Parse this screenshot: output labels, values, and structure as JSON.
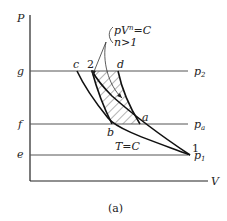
{
  "figure": {
    "caption": "(a)",
    "axes": {
      "y_label": "P",
      "x_label": "V"
    },
    "pressure_levels": [
      {
        "left_label": "g",
        "right_label": "p",
        "right_sub": "2"
      },
      {
        "left_label": "f",
        "right_label": "p",
        "right_sub": "a"
      },
      {
        "left_label": "e",
        "right_label": "p",
        "right_sub": "1"
      }
    ],
    "points": {
      "c": "c",
      "two": "2",
      "d": "d",
      "a": "a",
      "b": "b",
      "one": "1"
    },
    "annotations": {
      "polytropic_eq": "pV",
      "polytropic_exp": "n",
      "polytropic_rhs": "=C",
      "polytropic_cond": "n>1",
      "isotherm": "T=C"
    }
  }
}
